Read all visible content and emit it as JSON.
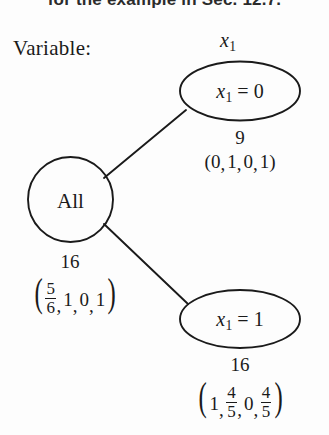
{
  "figure": {
    "cropped_header_text": "for the example in Sec. 12.7.",
    "variable_label": "Variable:",
    "branch_variable": {
      "symbol": "x",
      "subscript": "1"
    }
  },
  "root_node": {
    "label": "All",
    "count": "16",
    "tuple": {
      "open": "(",
      "close": ")",
      "items": [
        {
          "type": "fraction",
          "numerator": "5",
          "denominator": "6"
        },
        {
          "type": "number",
          "value": "1"
        },
        {
          "type": "number",
          "value": "0"
        },
        {
          "type": "number",
          "value": "1"
        }
      ]
    }
  },
  "children": [
    {
      "id": "branch-x1-equals-0",
      "node_label": {
        "symbol": "x",
        "subscript": "1",
        "relation": "=",
        "value": "0"
      },
      "count": "9",
      "tuple": {
        "open": "(",
        "close": ")",
        "items": [
          {
            "type": "number",
            "value": "0"
          },
          {
            "type": "number",
            "value": "1"
          },
          {
            "type": "number",
            "value": "0"
          },
          {
            "type": "number",
            "value": "1"
          }
        ]
      }
    },
    {
      "id": "branch-x1-equals-1",
      "node_label": {
        "symbol": "x",
        "subscript": "1",
        "relation": "=",
        "value": "1"
      },
      "count": "16",
      "tuple": {
        "open": "(",
        "close": ")",
        "items": [
          {
            "type": "number",
            "value": "1"
          },
          {
            "type": "fraction",
            "numerator": "4",
            "denominator": "5"
          },
          {
            "type": "number",
            "value": "0"
          },
          {
            "type": "fraction",
            "numerator": "4",
            "denominator": "5"
          }
        ]
      }
    }
  ],
  "style": {
    "stroke_color": "#1a1a1a",
    "text_color": "#1a1a1a",
    "background": "#fdfdfd"
  }
}
